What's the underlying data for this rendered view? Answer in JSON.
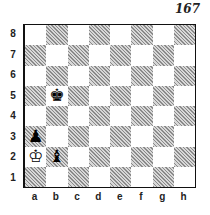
{
  "diagram": {
    "number": "167",
    "ranks": [
      "8",
      "7",
      "6",
      "5",
      "4",
      "3",
      "2",
      "1"
    ],
    "files": [
      "a",
      "b",
      "c",
      "d",
      "e",
      "f",
      "g",
      "h"
    ],
    "pieces": [
      {
        "square": "b5",
        "piece": "black-king",
        "glyph": "♚"
      },
      {
        "square": "a3",
        "piece": "black-pawn",
        "glyph": "♟"
      },
      {
        "square": "a2",
        "piece": "white-king",
        "glyph": "♔"
      },
      {
        "square": "b2",
        "piece": "black-bishop",
        "glyph": "♝"
      }
    ],
    "colors": {
      "dark_square": "#bdbdbd",
      "light_square": "#ffffff",
      "border": "#111111"
    }
  }
}
